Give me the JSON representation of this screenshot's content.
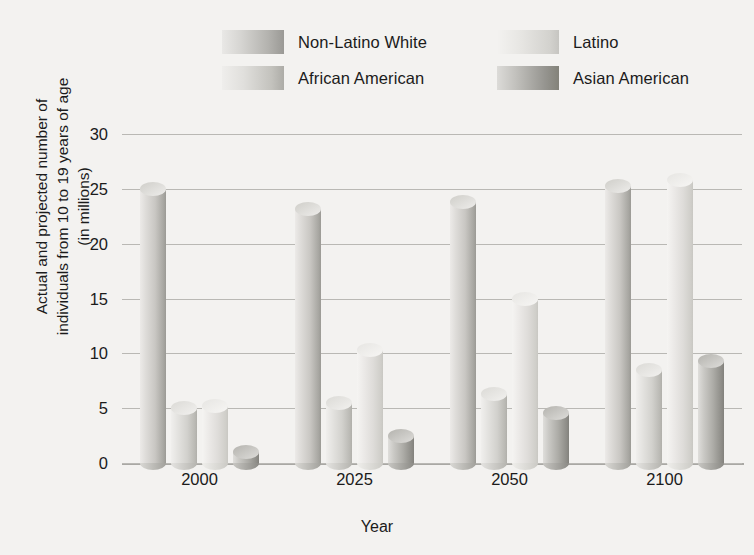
{
  "chart_data": {
    "type": "bar",
    "title": "",
    "xlabel": "Year",
    "ylabel": "Actual and projected number of individuals from 10 to 19 years of age (in millions)",
    "ylabel_line1": "Actual and projected number of",
    "ylabel_line2": "individuals from 10 to 19 years of age",
    "ylabel_line3": "(in millions)",
    "categories": [
      "2000",
      "2025",
      "2050",
      "2100"
    ],
    "ylim": [
      0,
      30
    ],
    "yticks": [
      "0",
      "5",
      "10",
      "15",
      "20",
      "25",
      "30"
    ],
    "grid": "horizontal",
    "legend_position": "top",
    "series": [
      {
        "name": "Non-Latino White",
        "color": "#c9c7c3",
        "values": [
          25.0,
          23.2,
          23.8,
          25.3
        ]
      },
      {
        "name": "African American",
        "color": "#d2d1cd",
        "values": [
          5.0,
          5.5,
          6.3,
          8.5
        ]
      },
      {
        "name": "Latino",
        "color": "#dedcd9",
        "values": [
          5.2,
          10.3,
          15.0,
          25.8
        ]
      },
      {
        "name": "Asian American",
        "color": "#adaca7",
        "values": [
          1.0,
          2.5,
          4.6,
          9.3
        ]
      }
    ]
  },
  "legend": {
    "items": [
      {
        "label": "Non-Latino White",
        "swatch": "swatch-non-latino-white"
      },
      {
        "label": "Latino",
        "swatch": "swatch-latino"
      },
      {
        "label": "African American",
        "swatch": "swatch-african-american"
      },
      {
        "label": "Asian American",
        "swatch": "swatch-asian-american"
      }
    ]
  }
}
